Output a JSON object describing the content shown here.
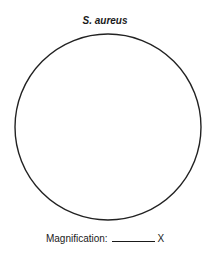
{
  "title": "S. aureus",
  "field_of_view": {
    "shape": "circle",
    "stroke_color": "#222222"
  },
  "magnification": {
    "label": "Magnification:",
    "value": "",
    "unit": "X"
  }
}
